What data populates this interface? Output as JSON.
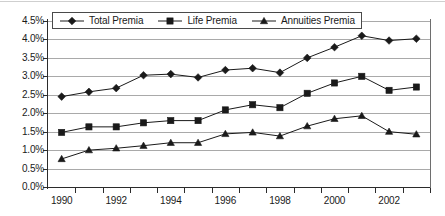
{
  "chart_data": {
    "type": "line",
    "title": "",
    "subtitle": "",
    "xlabel": "",
    "ylabel": "",
    "x": [
      1990,
      1991,
      1992,
      1993,
      1994,
      1995,
      1996,
      1997,
      1998,
      1999,
      2000,
      2001,
      2002,
      2003
    ],
    "x_tick_labels": [
      "1990",
      "1992",
      "1994",
      "1996",
      "1998",
      "2000",
      "2002"
    ],
    "x_tick_values": [
      1990,
      1992,
      1994,
      1996,
      1998,
      2000,
      2002
    ],
    "xlim": [
      1989.5,
      2003.5
    ],
    "y_tick_labels": [
      "0.0%",
      "0.5%",
      "1.0%",
      "1.5%",
      "2.0%",
      "2.5%",
      "3.0%",
      "3.5%",
      "4.0%",
      "4.5%"
    ],
    "y_tick_values": [
      0.0,
      0.5,
      1.0,
      1.5,
      2.0,
      2.5,
      3.0,
      3.5,
      4.0,
      4.5
    ],
    "ylim": [
      0.0,
      4.5
    ],
    "y_unit": "%",
    "grid": "horizontal",
    "legend_position": "top-left-inside",
    "series": [
      {
        "name": "Total Premia",
        "marker": "diamond",
        "color": "#1a1a1a",
        "values": [
          2.45,
          2.58,
          2.68,
          3.03,
          3.06,
          2.97,
          3.17,
          3.22,
          3.1,
          3.5,
          3.79,
          4.1,
          3.97,
          4.02
        ]
      },
      {
        "name": "Life Premia",
        "marker": "square",
        "color": "#1a1a1a",
        "values": [
          1.48,
          1.63,
          1.63,
          1.74,
          1.8,
          1.8,
          2.09,
          2.23,
          2.15,
          2.54,
          2.82,
          3.0,
          2.62,
          2.71
        ]
      },
      {
        "name": "Annuities Premia",
        "marker": "triangle",
        "color": "#1a1a1a",
        "values": [
          0.76,
          1.0,
          1.05,
          1.12,
          1.2,
          1.2,
          1.44,
          1.48,
          1.38,
          1.65,
          1.85,
          1.93,
          1.5,
          1.43
        ]
      }
    ]
  },
  "legend": {
    "items": [
      {
        "label": "Total Premia",
        "marker": "diamond"
      },
      {
        "label": "Life Premia",
        "marker": "square"
      },
      {
        "label": "Annuities Premia",
        "marker": "triangle"
      }
    ]
  },
  "axes": {
    "y_labels": [
      "4.5%",
      "4.0%",
      "3.5%",
      "3.0%",
      "2.5%",
      "2.0%",
      "1.5%",
      "1.0%",
      "0.5%",
      "0.0%"
    ],
    "x_labels": [
      "1990",
      "1992",
      "1994",
      "1996",
      "1998",
      "2000",
      "2002"
    ]
  }
}
